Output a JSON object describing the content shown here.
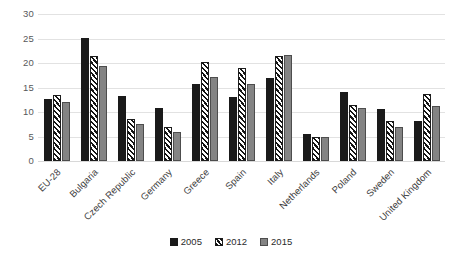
{
  "chart_data": {
    "type": "bar",
    "title": "",
    "subtitle": "",
    "xlabel": "",
    "ylabel": "",
    "ylim": [
      0,
      30
    ],
    "yticks": [
      0,
      5,
      10,
      15,
      20,
      25,
      30
    ],
    "grid": true,
    "legend_position": "bottom",
    "categories": [
      "EU-28",
      "Bulgaria",
      "Czech Republic",
      "Germany",
      "Greece",
      "Spain",
      "Italy",
      "Netherlands",
      "Poland",
      "Sweden",
      "United Kingdom"
    ],
    "series": [
      {
        "name": "2005",
        "color": "#1a1a1a",
        "pattern": "solid",
        "values": [
          12.7,
          25.1,
          13.3,
          10.9,
          15.8,
          13.0,
          16.9,
          5.5,
          14.0,
          10.6,
          8.1
        ]
      },
      {
        "name": "2012",
        "color": "#141414",
        "pattern": "diagonal-hatch",
        "values": [
          13.4,
          21.5,
          8.6,
          7.0,
          20.3,
          19.0,
          21.5,
          4.8,
          11.4,
          8.2,
          13.7
        ]
      },
      {
        "name": "2015",
        "color": "#848484",
        "pattern": "solid-gray",
        "values": [
          12.1,
          19.4,
          7.5,
          6.0,
          17.2,
          15.8,
          21.6,
          5.0,
          10.8,
          7.0,
          11.2
        ]
      }
    ]
  },
  "legend": {
    "items": [
      {
        "label": "2005"
      },
      {
        "label": "2012"
      },
      {
        "label": "2015"
      }
    ]
  }
}
